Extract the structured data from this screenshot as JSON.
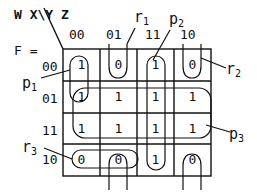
{
  "header": {
    "vars": "W X\\Y Z",
    "function_label": "F ="
  },
  "columns": [
    "00",
    "01",
    "11",
    "10"
  ],
  "rows": [
    "00",
    "01",
    "11",
    "10"
  ],
  "cells": [
    [
      "1",
      "0",
      "1",
      "0"
    ],
    [
      "1",
      "1",
      "1",
      "1"
    ],
    [
      "1",
      "1",
      "1",
      "1"
    ],
    [
      "0",
      "0",
      "1",
      "0"
    ]
  ],
  "groups": {
    "p1": {
      "name": "p",
      "sub": "1"
    },
    "p2": {
      "name": "p",
      "sub": "2"
    },
    "p3": {
      "name": "p",
      "sub": "3"
    },
    "r1": {
      "name": "r",
      "sub": "1"
    },
    "r2": {
      "name": "r",
      "sub": "2"
    },
    "r3": {
      "name": "r",
      "sub": "3"
    }
  }
}
